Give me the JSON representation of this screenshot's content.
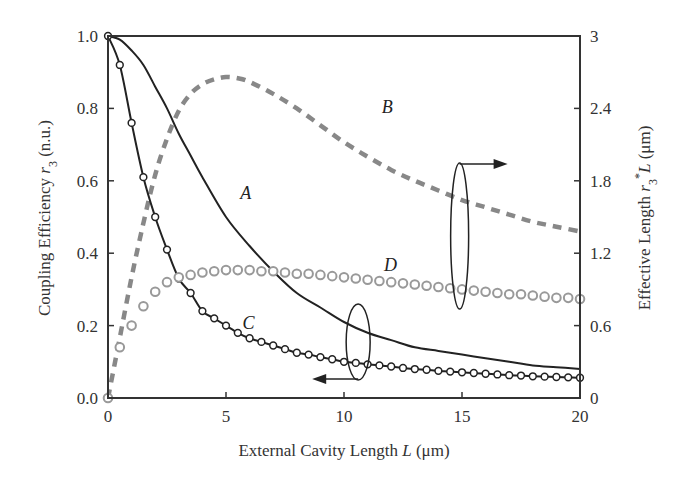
{
  "chart_data": {
    "type": "line",
    "title": "",
    "xlabel": "External Cavity Length L (μm)",
    "ylabel": "Coupling Efficiency r3 (n.u.)",
    "y2label": "Effective Length r3*L (μm)",
    "xlim": [
      0,
      20
    ],
    "ylim": [
      0,
      1.0
    ],
    "y2lim": [
      0,
      3
    ],
    "xticks": [
      "0",
      "5",
      "10",
      "15",
      "20"
    ],
    "yticks": [
      "0.0",
      "0.2",
      "0.4",
      "0.6",
      "0.8",
      "1.0"
    ],
    "y2ticks": [
      "0",
      "0.6",
      "1.2",
      "1.8",
      "2.4",
      "3"
    ],
    "grid": false,
    "series": [
      {
        "name": "A",
        "axis": "left",
        "style": "solid",
        "color": "#222222",
        "x": [
          0,
          0.5,
          1,
          1.5,
          2,
          2.5,
          3,
          3.5,
          4,
          5,
          6,
          7,
          8,
          9,
          10,
          11,
          12,
          13,
          14,
          15,
          16,
          17,
          18,
          19,
          20
        ],
        "y": [
          1.0,
          0.99,
          0.96,
          0.92,
          0.86,
          0.8,
          0.73,
          0.67,
          0.61,
          0.5,
          0.42,
          0.35,
          0.29,
          0.25,
          0.21,
          0.18,
          0.16,
          0.14,
          0.13,
          0.12,
          0.11,
          0.1,
          0.09,
          0.085,
          0.08
        ]
      },
      {
        "name": "B",
        "axis": "right",
        "style": "dashed",
        "color": "#888888",
        "x": [
          0,
          0.5,
          1,
          1.5,
          2,
          2.5,
          3,
          3.5,
          4,
          4.5,
          5,
          5.5,
          6,
          7,
          8,
          9,
          10,
          11,
          12,
          13,
          14,
          15,
          16,
          17,
          18,
          19,
          20
        ],
        "y": [
          0.0,
          0.5,
          1.0,
          1.45,
          1.85,
          2.15,
          2.38,
          2.52,
          2.6,
          2.64,
          2.66,
          2.65,
          2.62,
          2.52,
          2.4,
          2.26,
          2.12,
          2.0,
          1.89,
          1.8,
          1.72,
          1.64,
          1.58,
          1.52,
          1.46,
          1.42,
          1.38
        ]
      },
      {
        "name": "C",
        "axis": "left",
        "style": "solid-circles",
        "color": "#222222",
        "x": [
          0,
          0.5,
          1,
          1.5,
          2,
          2.5,
          3,
          3.5,
          4,
          4.5,
          5,
          5.5,
          6,
          6.5,
          7,
          7.5,
          8,
          8.5,
          9,
          9.5,
          10,
          10.5,
          11,
          11.5,
          12,
          12.5,
          13,
          13.5,
          14,
          14.5,
          15,
          15.5,
          16,
          16.5,
          17,
          17.5,
          18,
          18.5,
          19,
          19.5,
          20
        ],
        "y": [
          1.0,
          0.92,
          0.76,
          0.61,
          0.5,
          0.41,
          0.33,
          0.29,
          0.24,
          0.22,
          0.2,
          0.18,
          0.165,
          0.155,
          0.145,
          0.135,
          0.125,
          0.12,
          0.113,
          0.107,
          0.1,
          0.097,
          0.093,
          0.09,
          0.087,
          0.083,
          0.08,
          0.078,
          0.075,
          0.073,
          0.071,
          0.069,
          0.067,
          0.065,
          0.063,
          0.062,
          0.06,
          0.059,
          0.058,
          0.057,
          0.056
        ]
      },
      {
        "name": "D",
        "axis": "right",
        "style": "circles",
        "color": "#999999",
        "x": [
          0,
          0.5,
          1,
          1.5,
          2,
          2.5,
          3,
          3.5,
          4,
          4.5,
          5,
          5.5,
          6,
          6.5,
          7,
          7.5,
          8,
          8.5,
          9,
          9.5,
          10,
          10.5,
          11,
          11.5,
          12,
          12.5,
          13,
          13.5,
          14,
          14.5,
          15,
          15.5,
          16,
          16.5,
          17,
          17.5,
          18,
          18.5,
          19,
          19.5,
          20
        ],
        "y": [
          0.0,
          0.42,
          0.6,
          0.76,
          0.88,
          0.96,
          1.0,
          1.02,
          1.04,
          1.05,
          1.06,
          1.06,
          1.06,
          1.05,
          1.05,
          1.04,
          1.03,
          1.03,
          1.02,
          1.01,
          1.0,
          0.99,
          0.98,
          0.97,
          0.96,
          0.95,
          0.94,
          0.93,
          0.92,
          0.91,
          0.9,
          0.89,
          0.88,
          0.87,
          0.86,
          0.86,
          0.85,
          0.84,
          0.83,
          0.83,
          0.82
        ]
      }
    ],
    "annotations": [
      {
        "text": "A",
        "x": 5.6,
        "y": 0.55
      },
      {
        "text": "B",
        "x": 11.6,
        "y": 2.36
      },
      {
        "text": "C",
        "x": 5.7,
        "y": 0.19
      },
      {
        "text": "D",
        "x": 11.7,
        "y": 1.05
      },
      {
        "text": "ellipse+arrow pointing right → right axis (B, D)",
        "x": 14.9
      },
      {
        "text": "ellipse+arrow pointing left → left axis (A, C)",
        "x": 10.6
      }
    ]
  },
  "labels": {
    "xlabel_main": "External Cavity Length ",
    "xlabel_var": "L",
    "xlabel_unit": " (μm)",
    "ylabel_main": "Coupling Efficiency ",
    "ylabel_var": "r",
    "ylabel_sub": "3",
    "ylabel_unit": " (n.u.)",
    "y2label_main": "Effective Length ",
    "y2label_var": "r",
    "y2label_sub": "3",
    "y2label_star": "*",
    "y2label_var2": "L",
    "y2label_unit": " (μm)"
  }
}
